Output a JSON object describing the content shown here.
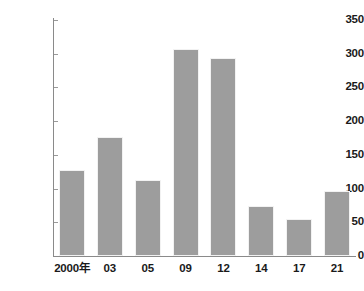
{
  "chart_data": {
    "type": "bar",
    "title": "",
    "subtitle": "",
    "xlabel": "",
    "ylabel": "",
    "categories": [
      "2000年",
      "03",
      "05",
      "09",
      "12",
      "14",
      "17",
      "21"
    ],
    "values": [
      127,
      177,
      113,
      307,
      294,
      74,
      55,
      96
    ],
    "ylim": [
      0,
      350
    ],
    "yticks": [
      0,
      50,
      100,
      150,
      200,
      250,
      300,
      350
    ],
    "ytick_labels": [
      "0",
      "50",
      "100",
      "150",
      "200",
      "250",
      "300",
      "350"
    ],
    "grid": false,
    "legend": null,
    "legend_position": "none",
    "series": [
      {
        "name": "",
        "values": [
          127,
          177,
          113,
          307,
          294,
          74,
          55,
          96
        ],
        "color": "#9d9d9d"
      }
    ],
    "annotations": []
  },
  "colors": {
    "bar_fill": "#9d9d9d",
    "bar_edge": "#f2f2f2",
    "axis": "#8a8a8a",
    "text": "#1a1a1a",
    "background": "#ffffff"
  }
}
